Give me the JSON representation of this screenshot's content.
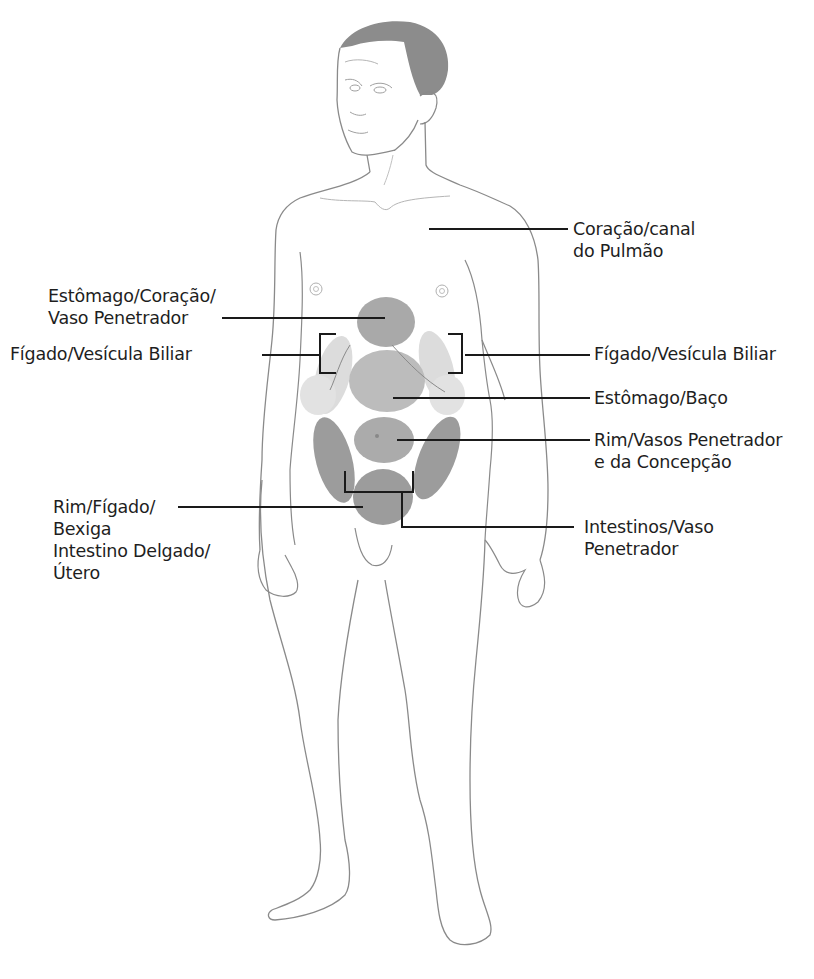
{
  "diagram": {
    "colors": {
      "outline": "#8a8a8a",
      "hair": "#8c8c8c",
      "zone_dark": "#9a9a9a",
      "zone_medium": "#b2b2b2",
      "zone_light": "#d9d9d9",
      "leader_line": "#1a1a1a",
      "text": "#1e1e1e"
    },
    "labels": {
      "heart_lung": {
        "line1": "Coração/canal",
        "line2": "do Pulmão"
      },
      "stomach_heart": {
        "line1": "Estômago/Coração/",
        "line2": "Vaso Penetrador"
      },
      "liver_gallbladder_left": {
        "line1": "Fígado/Vesícula Biliar"
      },
      "liver_gallbladder_right": {
        "line1": "Fígado/Vesícula Biliar"
      },
      "stomach_spleen": {
        "line1": "Estômago/Baço"
      },
      "kidney_vessels": {
        "line1": "Rim/Vasos Penetrador",
        "line2": "e da Concepção"
      },
      "kidney_liver_bladder": {
        "line1": "Rim/Fígado/",
        "line2": "Bexiga",
        "line3": "Intestino Delgado/",
        "line4": "Útero"
      },
      "intestines_vessel": {
        "line1": "Intestinos/Vaso",
        "line2": "Penetrador"
      }
    }
  }
}
